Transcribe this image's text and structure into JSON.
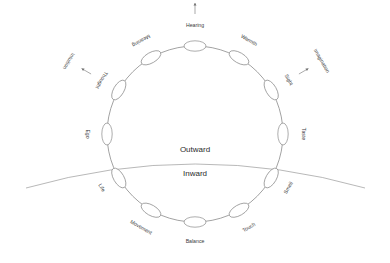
{
  "diagram": {
    "center_labels": {
      "outward": "Outward",
      "inward": "Inward"
    },
    "colors": {
      "stroke": "#8a8a8a",
      "horizon": "#9a9a9a",
      "text": "#3a3a3a",
      "center_text": "#2b2b2b",
      "background": "#ffffff"
    },
    "nodes": [
      {
        "label": "Hearing",
        "angle": -90,
        "rotation": 0
      },
      {
        "label": "Warmth",
        "angle": -60,
        "rotation": -60
      },
      {
        "label": "Sight",
        "angle": -30,
        "rotation": -30
      },
      {
        "label": "Taste",
        "angle": 0,
        "rotation": 90
      },
      {
        "label": "Smell",
        "angle": 30,
        "rotation": 30
      },
      {
        "label": "Touch",
        "angle": 60,
        "rotation": 60
      },
      {
        "label": "Balance",
        "angle": 90,
        "rotation": 0
      },
      {
        "label": "Movement",
        "angle": 120,
        "rotation": -60
      },
      {
        "label": "Life",
        "angle": 150,
        "rotation": -30
      },
      {
        "label": "Ego",
        "angle": 180,
        "rotation": -90
      },
      {
        "label": "Thought",
        "angle": 210,
        "rotation": 30
      },
      {
        "label": "Meaning",
        "angle": 240,
        "rotation": 60
      }
    ],
    "outer_annotations": [
      {
        "label": "Inspiration",
        "from_node": "Hearing",
        "rotation": 0
      },
      {
        "label": "Imagination",
        "from_node": "Sight",
        "rotation": -60
      },
      {
        "label": "Intuition",
        "from_node": "Thought",
        "rotation": -60
      }
    ]
  }
}
